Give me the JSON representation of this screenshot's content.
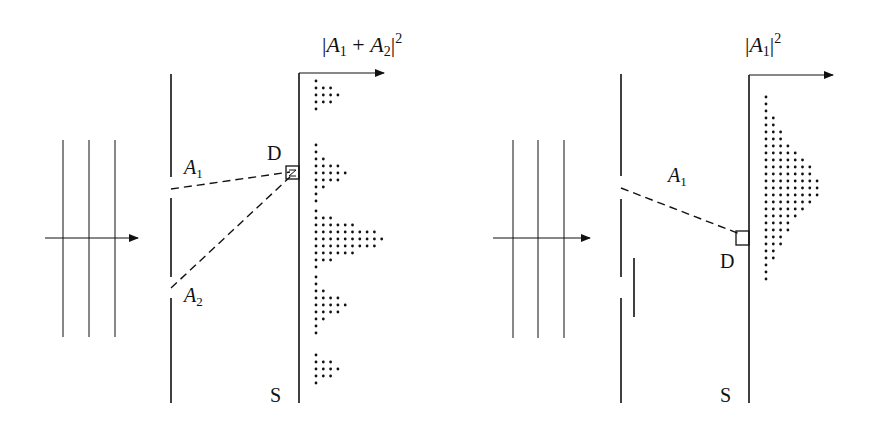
{
  "panels": [
    {
      "id": "both-slits-open",
      "intensity_label": {
        "prefix": "|",
        "a": "A",
        "a_sub": "1",
        "op": " + ",
        "b": "A",
        "b_sub": "2",
        "suffix": "|",
        "sup": "2"
      },
      "path_labels": [
        {
          "name": "A",
          "sub": "1"
        },
        {
          "name": "A",
          "sub": "2"
        }
      ],
      "detector_label": "D",
      "screen_label": "S",
      "pattern": "interference",
      "pattern_rows": [
        {
          "y": 81,
          "n": 1
        },
        {
          "y": 88,
          "n": 3
        },
        {
          "y": 95,
          "n": 4
        },
        {
          "y": 102,
          "n": 3
        },
        {
          "y": 109,
          "n": 1
        },
        {
          "y": 145,
          "n": 1
        },
        {
          "y": 152,
          "n": 1
        },
        {
          "y": 159,
          "n": 2
        },
        {
          "y": 166,
          "n": 4
        },
        {
          "y": 173,
          "n": 5
        },
        {
          "y": 180,
          "n": 4
        },
        {
          "y": 187,
          "n": 2
        },
        {
          "y": 194,
          "n": 1
        },
        {
          "y": 201,
          "n": 1
        },
        {
          "y": 211,
          "n": 1
        },
        {
          "y": 218,
          "n": 3
        },
        {
          "y": 225,
          "n": 6
        },
        {
          "y": 232,
          "n": 9
        },
        {
          "y": 239,
          "n": 10
        },
        {
          "y": 246,
          "n": 9
        },
        {
          "y": 253,
          "n": 6
        },
        {
          "y": 260,
          "n": 3
        },
        {
          "y": 267,
          "n": 1
        },
        {
          "y": 277,
          "n": 1
        },
        {
          "y": 284,
          "n": 1
        },
        {
          "y": 291,
          "n": 2
        },
        {
          "y": 298,
          "n": 4
        },
        {
          "y": 305,
          "n": 5
        },
        {
          "y": 312,
          "n": 4
        },
        {
          "y": 319,
          "n": 2
        },
        {
          "y": 326,
          "n": 1
        },
        {
          "y": 333,
          "n": 1
        },
        {
          "y": 355,
          "n": 1
        },
        {
          "y": 362,
          "n": 3
        },
        {
          "y": 369,
          "n": 4
        },
        {
          "y": 376,
          "n": 3
        },
        {
          "y": 383,
          "n": 1
        }
      ]
    },
    {
      "id": "one-slit-blocked",
      "intensity_label": {
        "prefix": "|",
        "a": "A",
        "a_sub": "1",
        "suffix": "|",
        "sup": "2"
      },
      "path_labels": [
        {
          "name": "A",
          "sub": "1"
        }
      ],
      "detector_label": "D",
      "screen_label": "S",
      "pattern": "single-slit",
      "pattern_rows": [
        {
          "y": 97,
          "n": 1
        },
        {
          "y": 104,
          "n": 1
        },
        {
          "y": 111,
          "n": 1
        },
        {
          "y": 118,
          "n": 2
        },
        {
          "y": 125,
          "n": 2
        },
        {
          "y": 132,
          "n": 3
        },
        {
          "y": 139,
          "n": 3
        },
        {
          "y": 146,
          "n": 4
        },
        {
          "y": 153,
          "n": 5
        },
        {
          "y": 160,
          "n": 6
        },
        {
          "y": 167,
          "n": 7
        },
        {
          "y": 174,
          "n": 7
        },
        {
          "y": 181,
          "n": 8
        },
        {
          "y": 188,
          "n": 8
        },
        {
          "y": 195,
          "n": 8
        },
        {
          "y": 202,
          "n": 7
        },
        {
          "y": 209,
          "n": 6
        },
        {
          "y": 216,
          "n": 5
        },
        {
          "y": 223,
          "n": 4
        },
        {
          "y": 230,
          "n": 4
        },
        {
          "y": 237,
          "n": 3
        },
        {
          "y": 244,
          "n": 3
        },
        {
          "y": 251,
          "n": 2
        },
        {
          "y": 258,
          "n": 2
        },
        {
          "y": 265,
          "n": 1
        },
        {
          "y": 272,
          "n": 1
        },
        {
          "y": 279,
          "n": 1
        }
      ]
    }
  ],
  "colors": {
    "ink": "#111111",
    "background": "#ffffff"
  }
}
